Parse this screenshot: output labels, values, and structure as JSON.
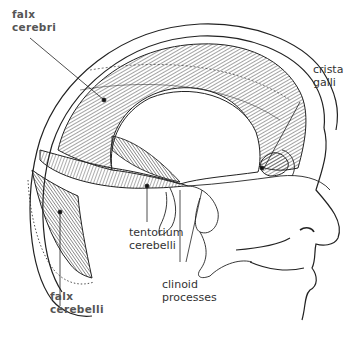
{
  "diagram": {
    "labels": [
      {
        "id": "falx-cerebri",
        "lines": [
          "falx",
          "cerebri"
        ],
        "bold": true
      },
      {
        "id": "crista-galli",
        "lines": [
          "crista",
          "galli"
        ],
        "bold": false
      },
      {
        "id": "tentorium-cerebelli",
        "lines": [
          "tentorium",
          "cerebelli"
        ],
        "bold": false
      },
      {
        "id": "falx-cerebelli",
        "lines": [
          "falx",
          "cerebelli"
        ],
        "bold": true
      },
      {
        "id": "clinoid-processes",
        "lines": [
          "clinoid",
          "processes"
        ],
        "bold": false
      }
    ],
    "colors": {
      "ink": "#222222",
      "bold_label": "#555555",
      "label": "#333333",
      "background": "#ffffff"
    }
  }
}
